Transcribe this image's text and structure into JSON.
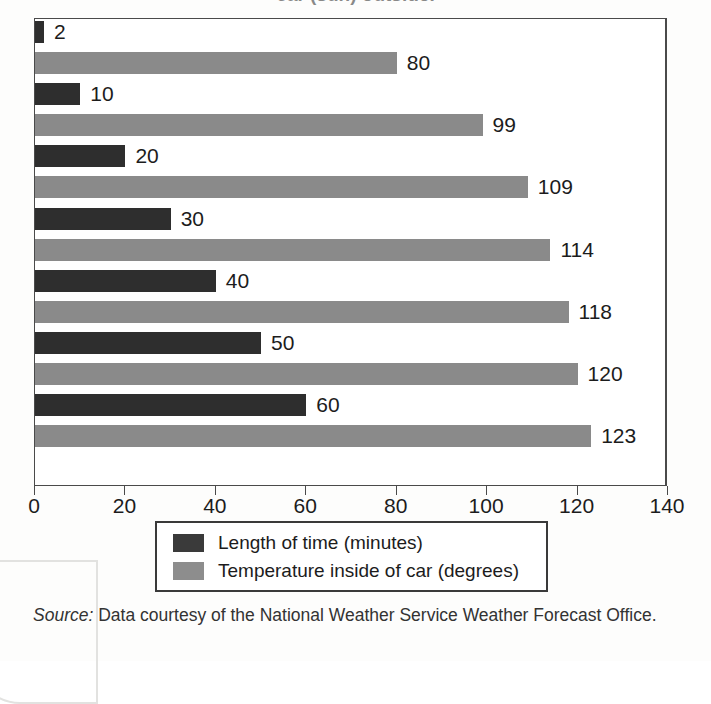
{
  "figure": {
    "title_partial": "car (sun) outside.",
    "source_label": "Source:",
    "source_text": "Data courtesy of the National Weather Service Weather Forecast Office."
  },
  "legend": {
    "items": [
      {
        "label": "Length of time (minutes)",
        "color": "#3a3a3a",
        "swatch_name": "legend-swatch-time"
      },
      {
        "label": "Temperature inside of car (degrees)",
        "color": "#8d8d8d",
        "swatch_name": "legend-swatch-temperature"
      }
    ]
  },
  "axis": {
    "ticks": [
      "0",
      "20",
      "40",
      "60",
      "80",
      "100",
      "120",
      "140"
    ]
  },
  "chart_data": {
    "type": "bar",
    "orientation": "horizontal",
    "title": "car (sun) outside.",
    "xlabel": "",
    "ylabel": "",
    "xlim": [
      0,
      140
    ],
    "xticks": [
      0,
      20,
      40,
      60,
      80,
      100,
      120,
      140
    ],
    "grid": false,
    "legend_position": "below-axes",
    "categories": [
      "1",
      "2",
      "3",
      "4",
      "5",
      "6",
      "7"
    ],
    "series": [
      {
        "name": "Length of time (minutes)",
        "color": "#2e2e2e",
        "values": [
          2,
          10,
          20,
          30,
          40,
          50,
          60
        ]
      },
      {
        "name": "Temperature inside of car (degrees)",
        "color": "#8a8a8a",
        "values": [
          80,
          99,
          109,
          114,
          118,
          120,
          123
        ]
      }
    ],
    "data_labels": [
      "2",
      "80",
      "10",
      "99",
      "20",
      "109",
      "30",
      "114",
      "40",
      "118",
      "50",
      "120",
      "60",
      "123"
    ],
    "source": "Data courtesy of the National Weather Service Weather Forecast Office."
  }
}
